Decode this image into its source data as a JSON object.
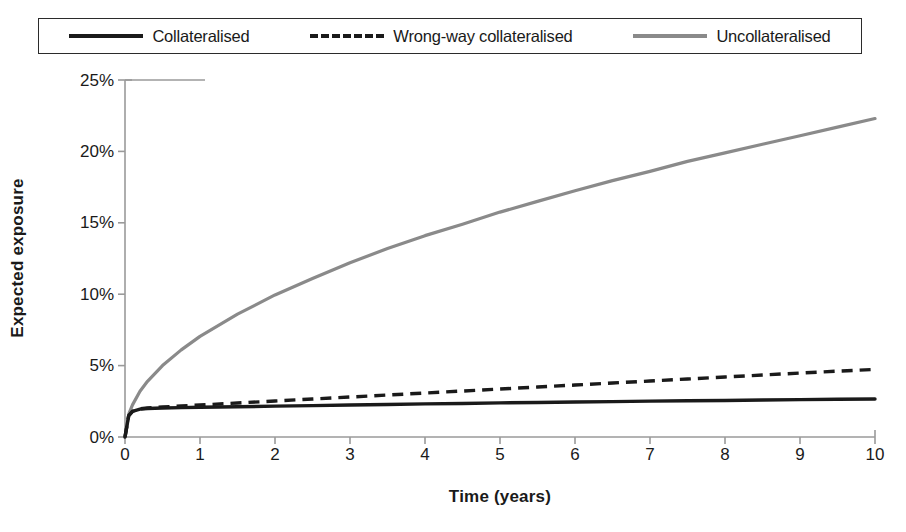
{
  "legend": {
    "position": "top",
    "items": [
      {
        "label": "Collateralised",
        "style": "solid",
        "color": "#1a1a1a"
      },
      {
        "label": "Wrong-way collateralised",
        "style": "dashed",
        "color": "#1a1a1a"
      },
      {
        "label": "Uncollateralised",
        "style": "solid",
        "color": "#8a8a8a"
      }
    ]
  },
  "axes": {
    "ylabel": "Expected exposure",
    "xlabel": "Time (years)",
    "yticks": [
      "0%",
      "5%",
      "10%",
      "15%",
      "20%",
      "25%"
    ],
    "xticks": [
      "0",
      "1",
      "2",
      "3",
      "4",
      "5",
      "6",
      "7",
      "8",
      "9",
      "10"
    ]
  },
  "chart_data": {
    "type": "line",
    "title": "",
    "xlabel": "Time (years)",
    "ylabel": "Expected exposure",
    "xlim": [
      0,
      10
    ],
    "ylim": [
      0,
      25
    ],
    "ytick_values": [
      0,
      5,
      10,
      15,
      20,
      25
    ],
    "ytick_labels": [
      "0%",
      "5%",
      "10%",
      "15%",
      "20%",
      "25%"
    ],
    "xtick_values": [
      0,
      1,
      2,
      3,
      4,
      5,
      6,
      7,
      8,
      9,
      10
    ],
    "xtick_labels": [
      "0",
      "1",
      "2",
      "3",
      "4",
      "5",
      "6",
      "7",
      "8",
      "9",
      "10"
    ],
    "grid": false,
    "units": "percent",
    "legend_position": "top",
    "x": [
      0,
      0.05,
      0.1,
      0.2,
      0.3,
      0.5,
      0.75,
      1,
      1.5,
      2,
      2.5,
      3,
      3.5,
      4,
      4.5,
      5,
      5.5,
      6,
      6.5,
      7,
      7.5,
      8,
      8.5,
      9,
      9.5,
      10
    ],
    "series": [
      {
        "name": "Collateralised",
        "color": "#1a1a1a",
        "style": "solid",
        "values": [
          0,
          1.5,
          1.8,
          1.95,
          2.0,
          2.03,
          2.06,
          2.08,
          2.12,
          2.16,
          2.2,
          2.24,
          2.28,
          2.32,
          2.35,
          2.39,
          2.42,
          2.45,
          2.48,
          2.51,
          2.54,
          2.56,
          2.59,
          2.62,
          2.64,
          2.66
        ]
      },
      {
        "name": "Wrong-way collateralised",
        "color": "#1a1a1a",
        "style": "dashed",
        "values": [
          0,
          1.5,
          1.8,
          1.97,
          2.03,
          2.1,
          2.17,
          2.24,
          2.38,
          2.52,
          2.66,
          2.8,
          2.94,
          3.08,
          3.22,
          3.36,
          3.5,
          3.64,
          3.78,
          3.92,
          4.06,
          4.2,
          4.34,
          4.48,
          4.61,
          4.73
        ]
      },
      {
        "name": "Uncollateralised",
        "color": "#8a8a8a",
        "style": "solid",
        "values": [
          0,
          1.6,
          2.25,
          3.2,
          3.9,
          5.0,
          6.1,
          7.05,
          8.6,
          9.95,
          11.1,
          12.2,
          13.2,
          14.1,
          14.9,
          15.75,
          16.5,
          17.25,
          17.95,
          18.6,
          19.3,
          19.9,
          20.5,
          21.1,
          21.7,
          22.3
        ]
      }
    ]
  }
}
